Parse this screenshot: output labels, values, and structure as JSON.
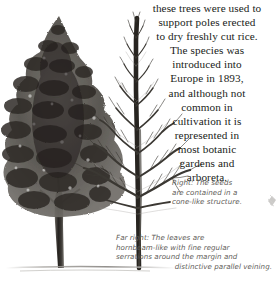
{
  "page": {
    "background_color": "#ffffff",
    "text_color": "#201c18",
    "caption_color": "#5d5a56"
  },
  "body_text": {
    "lines": [
      "these trees were used to",
      "support poles erected",
      "to dry freshly cut rice.",
      "The species was",
      "introduced into",
      "Europe in 1893,",
      "and although not",
      "common in",
      "cultivation it is",
      "represented in",
      "most botanic",
      "gardens and",
      "arboreta."
    ],
    "full_text": "these trees were used to support poles erected to dry freshly cut rice. The species was introduced into Europe in 1893, and although not common in cultivation it is represented in most botanic gardens and arboreta."
  },
  "captions": {
    "seeds": {
      "lead": "Right:",
      "lines": [
        "Right: The seeds",
        "are contained in a",
        "cone-like structure."
      ],
      "full_text": "Right: The seeds are contained in a cone-like structure."
    },
    "leaves": {
      "lead": "Far right:",
      "lines": [
        "Far right: The leaves are",
        "hornbeam-like with fine regular",
        "serrations around the margin and",
        "distinctive parallel veining."
      ],
      "full_text": "Far right: The leaves are hornbeam-like with fine regular serrations around the margin and distinctive parallel veining."
    }
  },
  "illustration": {
    "summer_tree_label": "foliated-tree-illustration",
    "winter_tree_label": "bare-tree-illustration",
    "cone_label": "cone-illustration",
    "ink_color": "#3a3835",
    "foliage_color": "#55524d",
    "trunk_color": "#2e2b27",
    "ground_color": "#8d8a86"
  }
}
